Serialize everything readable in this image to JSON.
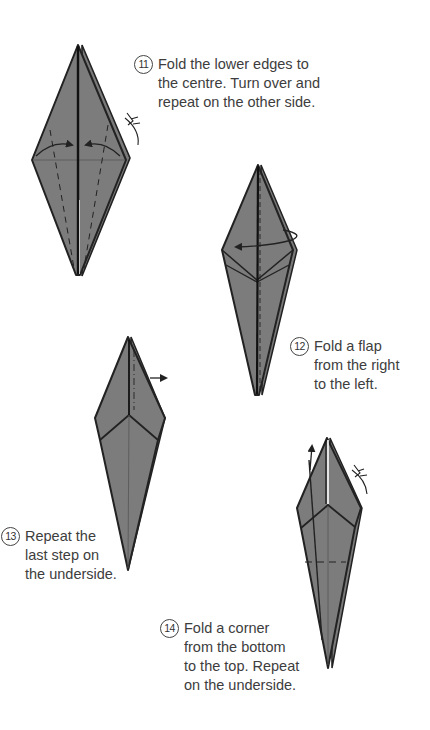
{
  "page": {
    "colors": {
      "paper": "#7a7a7a",
      "outline": "#222222",
      "background": "#ffffff",
      "text": "#3d3d3d"
    }
  },
  "steps": [
    {
      "number": "11",
      "lines": [
        "Fold the lower edges to",
        "the centre. Turn over and",
        "repeat on the other side."
      ]
    },
    {
      "number": "12",
      "lines": [
        "Fold a flap",
        "from the right",
        "to the left."
      ]
    },
    {
      "number": "13",
      "lines": [
        "Repeat the",
        "last step on",
        "the underside."
      ]
    },
    {
      "number": "14",
      "lines": [
        "Fold a corner",
        "from the bottom",
        "to the top. Repeat",
        "on the underside."
      ]
    }
  ],
  "symbols": {
    "turn_over": "turn-over-symbol",
    "fold_arrow": "fold-arrow",
    "valley_fold": "dashed-line"
  }
}
